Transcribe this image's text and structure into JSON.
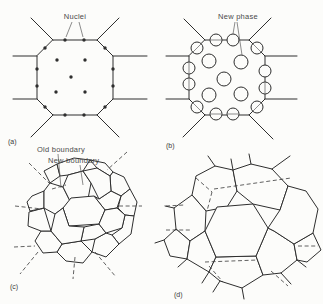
{
  "colors": {
    "background": "#fcfcfa",
    "ink": "#2e2e2e",
    "label_text": "#4a4a4a"
  },
  "panel_a": {
    "label": "(a)",
    "annotation": "Nuclei"
  },
  "panel_b": {
    "label": "(b)",
    "annotation": "New phase"
  },
  "panel_c": {
    "label": "(c)",
    "annotation_old": "Old boundary",
    "annotation_new": "New boundary"
  },
  "panel_d": {
    "label": "(d)"
  }
}
